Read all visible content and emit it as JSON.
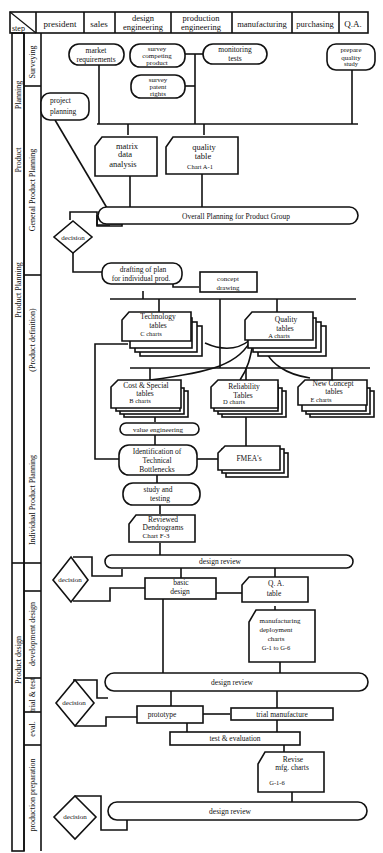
{
  "header": {
    "step_label": "step",
    "columns": [
      {
        "label": "president",
        "x": 36,
        "w": 48
      },
      {
        "label": "sales",
        "x": 84,
        "w": 31
      },
      {
        "label": "design engineering",
        "lines": [
          "design",
          "engineering"
        ],
        "x": 115,
        "w": 56
      },
      {
        "label": "production engineering",
        "lines": [
          "production",
          "engineering"
        ],
        "x": 171,
        "w": 61
      },
      {
        "label": "manufacturing",
        "x": 232,
        "w": 60
      },
      {
        "label": "purchasing",
        "x": 292,
        "w": 47
      },
      {
        "label": "Q.A.",
        "x": 339,
        "w": 29
      }
    ]
  },
  "phases": {
    "outer": [
      {
        "label": "Product Planning",
        "y0": 38,
        "y1": 560
      },
      {
        "label": "Product design",
        "y0": 560,
        "y1": 845
      }
    ],
    "middle": [
      {
        "label": "Product Planning (upper)",
        "text": "Product   Planning",
        "y0": 38,
        "y1": 175
      },
      {
        "label": "Individual / General",
        "text": "",
        "y0": 175,
        "y1": 560
      }
    ],
    "inner": [
      {
        "label": "Surveying",
        "y0": 38,
        "y1": 85
      },
      {
        "label": "General Product Planning",
        "y0": 85,
        "y1": 275
      },
      {
        "label": "(Product definition)",
        "y0": 275,
        "y1": 405
      },
      {
        "label": "Individual Product Planning",
        "y0": 405,
        "y1": 590
      },
      {
        "label": "development design",
        "y0": 590,
        "y1": 690
      },
      {
        "label": "trial & test",
        "y0": 690,
        "y1": 755
      },
      {
        "label": "eval.",
        "y0": 755,
        "y1": 790
      },
      {
        "label": "production preparation",
        "y0": 790,
        "y1": 852
      }
    ]
  },
  "nodes": {
    "market_requirements": {
      "lines": [
        "market",
        "requirements"
      ]
    },
    "survey_competing": {
      "lines": [
        "survey",
        "competing",
        "product"
      ]
    },
    "monitoring_tests": {
      "lines": [
        "monitoring",
        "tests"
      ]
    },
    "survey_patent": {
      "lines": [
        "survey",
        "patent",
        "rights"
      ]
    },
    "prepare_quality": {
      "lines": [
        "prepare",
        "quality",
        "study"
      ]
    },
    "project_planning": {
      "lines": [
        "project",
        "planning"
      ]
    },
    "matrix_data": {
      "lines": [
        "matrix",
        "data",
        "analysis"
      ]
    },
    "quality_table": {
      "lines": [
        "quality",
        "table",
        "Chart A-1"
      ]
    },
    "overall_planning": {
      "text": "Overall Planning for Product Group"
    },
    "decision_1": {
      "text": "decision"
    },
    "drafting_plan": {
      "lines": [
        "drafting of plan",
        "for individual prod."
      ]
    },
    "concept_drawing": {
      "lines": [
        "concept",
        "drawing"
      ]
    },
    "technology_tables": {
      "lines": [
        "Technology",
        "tables",
        "C charts"
      ]
    },
    "quality_tables": {
      "lines": [
        "Quality",
        "tables",
        "A charts"
      ]
    },
    "cost_special": {
      "lines": [
        "Cost & Special",
        "tables",
        "B charts"
      ]
    },
    "reliability_tables": {
      "lines": [
        "Reliability",
        "Tables",
        "D charts"
      ]
    },
    "new_concept": {
      "lines": [
        "New Concept",
        "tables",
        "E charts"
      ]
    },
    "value_engineering": {
      "text": "value engineering"
    },
    "identification": {
      "lines": [
        "Identification of",
        "Technical",
        "Bottlenecks"
      ]
    },
    "fmea": {
      "text": "FMEA's"
    },
    "study_testing": {
      "lines": [
        "study and",
        "testing"
      ]
    },
    "reviewed_dendrograms": {
      "lines": [
        "Reviewed",
        "Dendrograms",
        "Chart F-3"
      ]
    },
    "design_review_1": {
      "text": "design  review"
    },
    "decision_2": {
      "text": "decision"
    },
    "basic_design": {
      "lines": [
        "basic",
        "design"
      ]
    },
    "qa_table": {
      "lines": [
        "Q. A.",
        "table"
      ]
    },
    "mfg_deployment": {
      "lines": [
        "manufacturing",
        "deployment",
        "charts",
        "G-1 to G-6"
      ]
    },
    "design_review_2": {
      "text": "design review"
    },
    "decision_3": {
      "text": "decision"
    },
    "prototype": {
      "text": "prototype"
    },
    "trial_manufacture": {
      "text": "trial manufacture"
    },
    "test_evaluation": {
      "text": "test & evaluation"
    },
    "revise_mfg": {
      "lines": [
        "Revise",
        "mfg. charts",
        "G-1-6"
      ]
    },
    "design_review_3": {
      "text": "design review"
    },
    "decision_4": {
      "text": "decision"
    }
  },
  "colors": {
    "ink": "#111111",
    "paper": "#ffffff"
  }
}
